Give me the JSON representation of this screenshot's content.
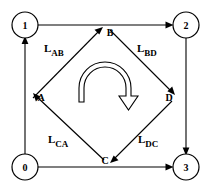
{
  "diagram": {
    "colors": {
      "background": "#ffffff",
      "stroke": "#000000",
      "fill": "#ffffff"
    },
    "outer_nodes": [
      {
        "id": "node-1",
        "label": "1",
        "position": "top-left",
        "cx": 25,
        "cy": 25
      },
      {
        "id": "node-2",
        "label": "2",
        "position": "top-right",
        "cx": 186,
        "cy": 25
      },
      {
        "id": "node-0",
        "label": "0",
        "position": "bottom-left",
        "cx": 25,
        "cy": 167
      },
      {
        "id": "node-3",
        "label": "3",
        "position": "bottom-right",
        "cx": 186,
        "cy": 167
      }
    ],
    "inner_points": [
      {
        "id": "point-a",
        "label": "A",
        "position": "left",
        "x": 38,
        "y": 97
      },
      {
        "id": "point-b",
        "label": "B",
        "position": "top",
        "x": 108,
        "y": 32
      },
      {
        "id": "point-c",
        "label": "C",
        "position": "bottom",
        "x": 108,
        "y": 160
      },
      {
        "id": "point-d",
        "label": "D",
        "position": "right",
        "x": 172,
        "y": 97
      }
    ],
    "edge_labels": [
      {
        "id": "label-lab",
        "base": "L",
        "sub": "AB",
        "text": "L_AB",
        "x": 45,
        "y": 54
      },
      {
        "id": "label-lbd",
        "base": "L",
        "sub": "BD",
        "text": "L_BD",
        "x": 140,
        "y": 54
      },
      {
        "id": "label-lca",
        "base": "L",
        "sub": "CA",
        "text": "L_CA",
        "x": 52,
        "y": 146
      },
      {
        "id": "label-ldc",
        "base": "L",
        "sub": "DC",
        "text": "L_DC",
        "x": 140,
        "y": 146
      }
    ],
    "outer_edges": [
      {
        "id": "edge-0-1",
        "from": "0",
        "to": "1",
        "direction": "up"
      },
      {
        "id": "edge-1-2",
        "from": "1",
        "to": "2",
        "direction": "right"
      },
      {
        "id": "edge-2-3",
        "from": "2",
        "to": "3",
        "direction": "down"
      },
      {
        "id": "edge-0-3",
        "from": "0",
        "to": "3",
        "direction": "right"
      }
    ],
    "inner_edges": [
      {
        "id": "edge-a-b",
        "from": "A",
        "to": "B",
        "label": "L_AB"
      },
      {
        "id": "edge-b-d",
        "from": "B",
        "to": "D",
        "label": "L_BD"
      },
      {
        "id": "edge-d-c",
        "from": "D",
        "to": "C",
        "label": "L_DC"
      },
      {
        "id": "edge-c-a",
        "from": "C",
        "to": "A",
        "label": "L_CA"
      }
    ],
    "center_arrow": {
      "id": "rotation-arrow",
      "shape": "hollow-semicircular-arc-arrow",
      "direction": "clockwise"
    }
  }
}
